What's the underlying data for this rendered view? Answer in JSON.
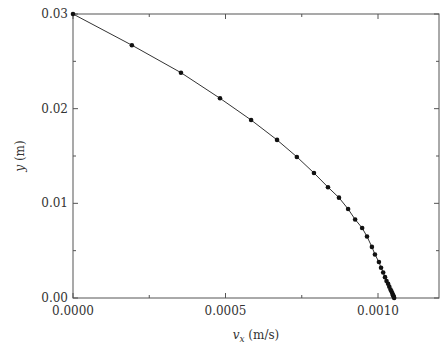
{
  "chart_data": {
    "type": "line",
    "title": "",
    "xlabel": "v_x (m/s)",
    "ylabel": "y (m)",
    "xlabel_parts": {
      "var": "v",
      "sub": "x",
      "unit": " (m/s)"
    },
    "ylabel_parts": {
      "var": "y",
      "unit": " (m)"
    },
    "xlim": [
      0,
      0.0012
    ],
    "ylim": [
      0,
      0.03
    ],
    "x_ticks": [
      0.0,
      0.0005,
      0.001
    ],
    "x_tick_labels": [
      "0.0000",
      "0.0005",
      "0.0010"
    ],
    "x_minor_step": 0.00025,
    "y_ticks": [
      0.0,
      0.01,
      0.02,
      0.03
    ],
    "y_tick_labels": [
      "0.00",
      "0.01",
      "0.02",
      "0.03"
    ],
    "y_minor_step": 0.005,
    "grid": false,
    "legend": null,
    "marker": "circle",
    "series": [
      {
        "name": "y vs v_x",
        "x": [
          0.0,
          0.000193,
          0.000354,
          0.000482,
          0.000584,
          0.000669,
          0.000734,
          0.00079,
          0.000836,
          0.000872,
          0.000902,
          0.000925,
          0.000948,
          0.000964,
          0.00098,
          0.00099,
          0.001003,
          0.00101,
          0.001017,
          0.001023,
          0.001028,
          0.001033,
          0.001037,
          0.001041,
          0.001044,
          0.001047,
          0.001049,
          0.001051,
          0.001052,
          0.001053
        ],
        "y": [
          0.03,
          0.0267,
          0.0238,
          0.0211,
          0.0188,
          0.0167,
          0.0149,
          0.0132,
          0.0117,
          0.0106,
          0.0094,
          0.0083,
          0.0074,
          0.0065,
          0.0054,
          0.0046,
          0.0038,
          0.0032,
          0.0027,
          0.0022,
          0.0018,
          0.0015,
          0.0012,
          0.0009,
          0.0007,
          0.0005,
          0.0003,
          0.0002,
          0.0001,
          0.0
        ]
      }
    ]
  }
}
